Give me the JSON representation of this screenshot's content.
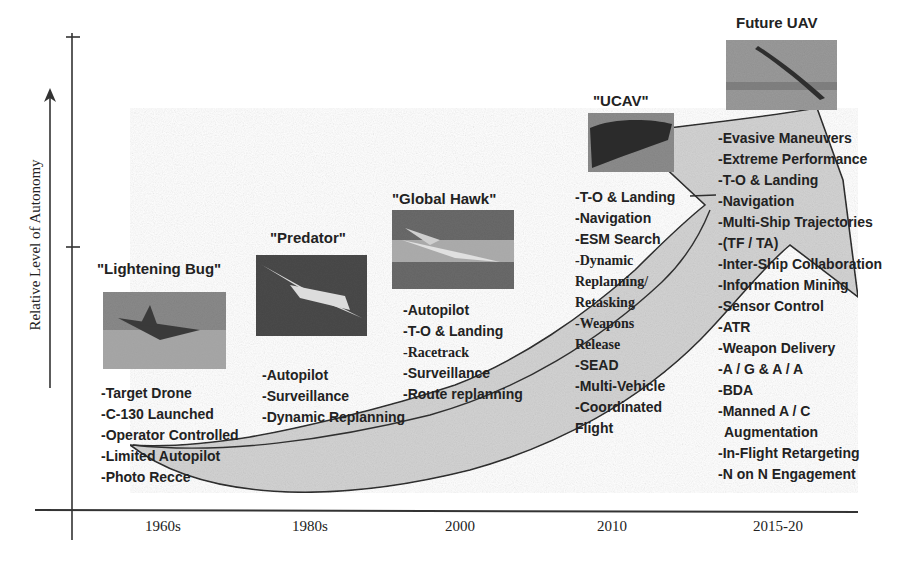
{
  "figure": {
    "y_axis_label": "Relative Level of Autonomy",
    "x_axis_labels": [
      "1960s",
      "1980s",
      "2000",
      "2010",
      "2015-20"
    ],
    "colors": {
      "arrow_fill": "#d3d3d3",
      "line": "#2a2a2a",
      "text": "#222222",
      "background": "#ffffff"
    },
    "stages": [
      {
        "name": "\"Lightening Bug\"",
        "era": "1960s",
        "image": "lightening-bug-photo",
        "capabilities": [
          "-Target  Drone",
          "-C-130  Launched",
          "-Operator  Controlled",
          "-Limited  Autopilot",
          "-Photo  Recce"
        ]
      },
      {
        "name": "\"Predator\"",
        "era": "1980s",
        "image": "predator-photo",
        "capabilities": [
          "-Autopilot",
          "-Surveillance",
          "-Dynamic  Replanning"
        ]
      },
      {
        "name": "\"Global  Hawk\"",
        "era": "2000",
        "image": "global-hawk-photo",
        "capabilities": [
          "-Autopilot",
          "-T-O & Landing",
          "-Racetrack",
          "-Surveillance",
          "-Route  replanning"
        ]
      },
      {
        "name": "\"UCAV\"",
        "era": "2010",
        "image": "ucav-photo",
        "capabilities": [
          "-T-O & Landing",
          "-Navigation",
          "-ESM  Search",
          "-Dynamic",
          "Replanning/",
          "Retasking",
          "-Weapons",
          "Release",
          "-SEAD",
          "-Multi-Vehicle",
          "-Coordinated",
          "Flight"
        ]
      },
      {
        "name": "Future  UAV",
        "era": "2015-20",
        "image": "future-uav-photo",
        "capabilities": [
          "-Evasive  Maneuvers",
          "-Extreme  Performance",
          "-T-O & Landing",
          "-Navigation",
          "-Multi-Ship  Trajectories",
          "-(TF / TA)",
          "-Inter-Ship  Collaboration",
          "-Information  Mining",
          "-Sensor  Control",
          "-ATR",
          "-Weapon  Delivery",
          "-A / G & A / A",
          "-BDA",
          "-Manned  A / C",
          "Augmentation",
          "-In-Flight  Retargeting",
          "-N on N  Engagement"
        ]
      }
    ]
  }
}
